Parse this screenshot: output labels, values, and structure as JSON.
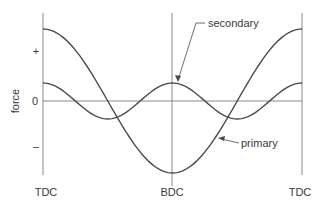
{
  "chart_data": {
    "type": "line",
    "title": "",
    "xlabel": "",
    "ylabel": "force",
    "x_tick_labels": [
      "TDC",
      "BDC",
      "TDC"
    ],
    "y_tick_labels": [
      "+",
      "0",
      "–"
    ],
    "x_range_deg": [
      0,
      360
    ],
    "ylim": [
      -1,
      1
    ],
    "grid": false,
    "series": [
      {
        "name": "primary",
        "function": "cos(theta)",
        "x_deg": [
          0,
          45,
          90,
          135,
          180,
          225,
          270,
          315,
          360
        ],
        "values": [
          1.0,
          0.71,
          0.0,
          -0.71,
          -1.0,
          -0.71,
          0.0,
          0.71,
          1.0
        ]
      },
      {
        "name": "secondary",
        "function": "0.25*cos(2*theta)",
        "x_deg": [
          0,
          45,
          90,
          135,
          180,
          225,
          270,
          315,
          360
        ],
        "values": [
          0.25,
          0.0,
          -0.25,
          0.0,
          0.25,
          0.0,
          -0.25,
          0.0,
          0.25
        ]
      }
    ],
    "annotations": [
      {
        "text": "secondary",
        "points_to": "secondary curve near BDC"
      },
      {
        "text": "primary",
        "points_to": "primary curve between BDC and right TDC"
      }
    ]
  },
  "labels": {
    "ylabel": "force",
    "plus": "+",
    "zero": "0",
    "minus": "–",
    "tdc_left": "TDC",
    "bdc": "BDC",
    "tdc_right": "TDC",
    "secondary": "secondary",
    "primary": "primary"
  },
  "colors": {
    "curve": "#4a4a4a",
    "axis": "#8a8a8a",
    "text": "#3a3a3a"
  }
}
